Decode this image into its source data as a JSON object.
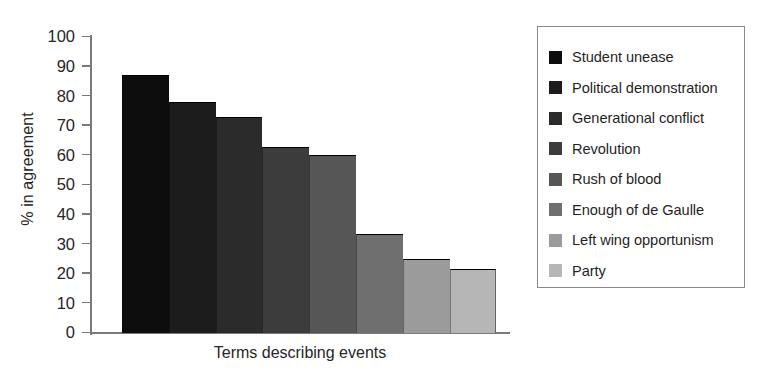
{
  "chart_data": {
    "type": "bar",
    "title": "",
    "xlabel": "Terms describing events",
    "ylabel": "% in agreement",
    "ylim": [
      0,
      100
    ],
    "ytick_step": 10,
    "ytick_labels": [
      "100",
      "90",
      "80",
      "70",
      "60",
      "50",
      "40",
      "30",
      "20",
      "10",
      "0"
    ],
    "ytick_values": [
      100,
      90,
      80,
      70,
      60,
      50,
      40,
      30,
      20,
      10,
      0
    ],
    "grid": false,
    "legend_position": "right",
    "categories": [
      "Student unease",
      "Political demonstration",
      "Generational conflict",
      "Revolution",
      "Rush of blood",
      "Enough of de Gaulle",
      "Left wing opportunism",
      "Party"
    ],
    "values": [
      87,
      78,
      73,
      63,
      60,
      33.5,
      25,
      21.5
    ],
    "colors": [
      "#0d0d0d",
      "#1c1c1c",
      "#2b2b2b",
      "#3c3c3c",
      "#565656",
      "#6f6f6f",
      "#9b9b9b",
      "#b6b6b6"
    ]
  },
  "legend": {
    "items": [
      {
        "label": "Student unease",
        "color": "#0d0d0d"
      },
      {
        "label": "Political demonstration",
        "color": "#1c1c1c"
      },
      {
        "label": "Generational conflict",
        "color": "#2b2b2b"
      },
      {
        "label": "Revolution",
        "color": "#3c3c3c"
      },
      {
        "label": "Rush of blood",
        "color": "#565656"
      },
      {
        "label": "Enough of de Gaulle",
        "color": "#6f6f6f"
      },
      {
        "label": "Left wing opportunism",
        "color": "#9b9b9b"
      },
      {
        "label": "Party",
        "color": "#b6b6b6"
      }
    ]
  }
}
